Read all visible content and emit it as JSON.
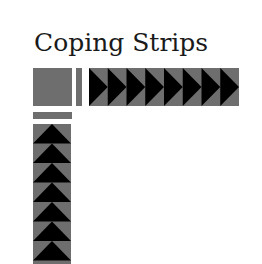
{
  "title": "Coping Strips",
  "colors": {
    "background": "#ffffff",
    "fabric_gray": "#6e6e6e",
    "triangle_black": "#000000",
    "text": "#1a1a1a"
  },
  "pieces": {
    "corner_square": "gray square",
    "vertical_bar": "narrow gray strip",
    "horizontal_bar": "narrow gray strip",
    "horizontal_strip": {
      "triangles": 8,
      "direction": "right"
    },
    "vertical_strip": {
      "triangles": 7,
      "direction": "up"
    }
  }
}
